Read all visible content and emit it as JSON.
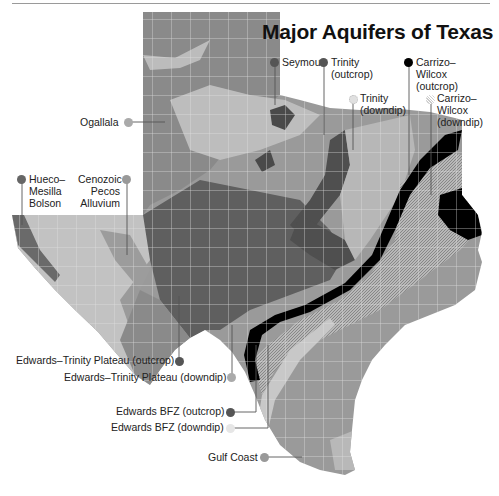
{
  "title": "Major Aquifers of Texas",
  "colors": {
    "ogallala": "#8a8a8a",
    "ogallala_light": "#b9b9b9",
    "seymour": "#4a4a4a",
    "trinity_outcrop": "#5a5a5a",
    "trinity_downdip": "#c8c8c8",
    "carrizo_outcrop": "#000000",
    "carrizo_downdip": "#a9a9a9",
    "edwards_trinity_outcrop": "#5f5f5f",
    "edwards_trinity_downdip": "#a0a0a0",
    "edwards_bfz_outcrop": "#555555",
    "edwards_bfz_downdip": "#d8d8d8",
    "gulf_coast": "#8f8f8f",
    "hueco": "#6a6a6a",
    "pecos": "#9c9c9c",
    "county_lines": "#e6e6e6"
  },
  "legend": {
    "seymour": "Seymour",
    "trinity_outcrop": [
      "Trinity",
      "(outcrop)"
    ],
    "trinity_downdip": [
      "Trinity",
      "(downdip)"
    ],
    "carrizo_outcrop": [
      "Carrizo–",
      "Wilcox",
      "(outcrop)"
    ],
    "carrizo_downdip": [
      "Carrizo–",
      "Wilcox",
      "(downdip)"
    ],
    "ogallala": "Ogallala",
    "hueco": [
      "Hueco–",
      "Mesilla",
      "Bolson"
    ],
    "pecos": [
      "Cenozoic",
      "Pecos",
      "Alluvium"
    ],
    "edwards_trinity_outcrop": "Edwards–Trinity Plateau (outcrop)",
    "edwards_trinity_downdip": "Edwards–Trinity Plateau (downdip)",
    "edwards_bfz_outcrop": "Edwards BFZ (outcrop)",
    "edwards_bfz_downdip": "Edwards BFZ (downdip)",
    "gulf_coast": "Gulf Coast"
  }
}
